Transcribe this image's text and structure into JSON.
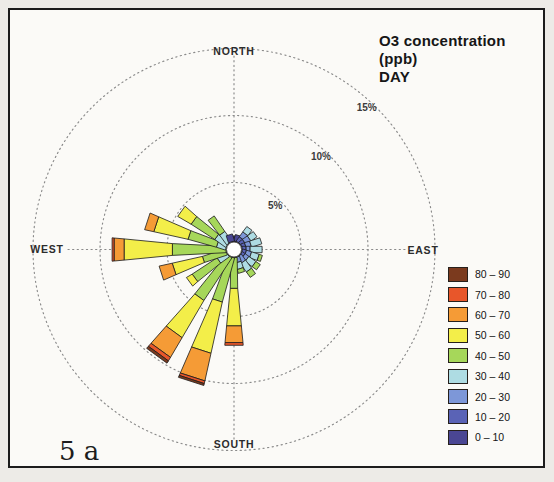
{
  "title": {
    "line1": "O3 concentration (ppb)",
    "line2": "DAY"
  },
  "corner_label": "5 a",
  "compass": {
    "north": "NORTH",
    "south": "SOUTH",
    "east": "EAST",
    "west": "WEST"
  },
  "chart_data": {
    "type": "bar",
    "subtype": "wind-rose-stacked-polar",
    "title": "O3 concentration (ppb)",
    "subtitle": "DAY",
    "radial_axis": "frequency percent",
    "rings": [
      {
        "pct": 5,
        "label": "5%"
      },
      {
        "pct": 10,
        "label": "10%"
      },
      {
        "pct": 15,
        "label": "15%"
      }
    ],
    "sector_step_deg": 18,
    "bins": [
      {
        "label": "0 – 10",
        "color": "#4a4693"
      },
      {
        "label": "10 – 20",
        "color": "#5a63b6"
      },
      {
        "label": "20 – 30",
        "color": "#7d97d8"
      },
      {
        "label": "30 – 40",
        "color": "#aedce3"
      },
      {
        "label": "40 – 50",
        "color": "#a6d75a"
      },
      {
        "label": "50 – 60",
        "color": "#f3ee49"
      },
      {
        "label": "60 – 70",
        "color": "#f59b36"
      },
      {
        "label": "70 – 80",
        "color": "#e8562a"
      },
      {
        "label": "80 – 90",
        "color": "#7b3a1e"
      }
    ],
    "petals": [
      {
        "dir": 0,
        "segments": [
          [
            0,
            0.6,
            1.0
          ]
        ]
      },
      {
        "dir": 18,
        "segments": [
          [
            0,
            0.6,
            1.1
          ]
        ]
      },
      {
        "dir": 36,
        "segments": [
          [
            1,
            0.6,
            1.0
          ],
          [
            2,
            1.0,
            1.45
          ],
          [
            3,
            1.45,
            1.95
          ]
        ]
      },
      {
        "dir": 54,
        "segments": [
          [
            1,
            0.6,
            0.95
          ],
          [
            2,
            0.95,
            1.4
          ],
          [
            3,
            1.4,
            1.95
          ]
        ]
      },
      {
        "dir": 72,
        "segments": [
          [
            1,
            0.6,
            0.9
          ],
          [
            2,
            0.9,
            1.3
          ],
          [
            3,
            1.3,
            2.1
          ]
        ]
      },
      {
        "dir": 90,
        "segments": [
          [
            1,
            0.6,
            0.9
          ],
          [
            2,
            0.9,
            1.2
          ],
          [
            3,
            1.2,
            2.1
          ]
        ]
      },
      {
        "dir": 108,
        "segments": [
          [
            1,
            0.6,
            0.9
          ],
          [
            2,
            0.9,
            1.3
          ],
          [
            3,
            1.3,
            1.9
          ],
          [
            4,
            1.9,
            2.15
          ]
        ]
      },
      {
        "dir": 126,
        "segments": [
          [
            1,
            0.6,
            0.85
          ],
          [
            2,
            0.85,
            1.2
          ],
          [
            3,
            1.2,
            1.85
          ],
          [
            4,
            1.85,
            2.25
          ]
        ]
      },
      {
        "dir": 144,
        "segments": [
          [
            2,
            0.6,
            1.15
          ],
          [
            3,
            1.15,
            1.9
          ],
          [
            4,
            1.9,
            2.4
          ]
        ]
      },
      {
        "dir": 162,
        "segments": [
          [
            2,
            0.6,
            1.0
          ],
          [
            3,
            1.0,
            1.5
          ],
          [
            4,
            1.5,
            1.8
          ]
        ]
      },
      {
        "dir": 180,
        "segments": [
          [
            4,
            0.6,
            2.9
          ],
          [
            5,
            2.9,
            5.7
          ],
          [
            6,
            5.7,
            6.95
          ],
          [
            7,
            6.95,
            7.15
          ]
        ]
      },
      {
        "dir": 198,
        "segments": [
          [
            4,
            0.6,
            4.0
          ],
          [
            5,
            4.0,
            7.9
          ],
          [
            6,
            7.9,
            10.0
          ],
          [
            7,
            10.0,
            10.2
          ],
          [
            8,
            10.2,
            10.35
          ]
        ]
      },
      {
        "dir": 216,
        "segments": [
          [
            4,
            0.6,
            4.4
          ],
          [
            5,
            4.4,
            7.6
          ],
          [
            6,
            7.6,
            9.3
          ],
          [
            7,
            9.3,
            9.6
          ],
          [
            8,
            9.6,
            9.8
          ]
        ]
      },
      {
        "dir": 234,
        "segments": [
          [
            3,
            0.6,
            1.4
          ],
          [
            4,
            1.4,
            3.6
          ],
          [
            5,
            3.6,
            4.1
          ]
        ]
      },
      {
        "dir": 252,
        "segments": [
          [
            4,
            0.6,
            2.4
          ],
          [
            5,
            2.4,
            4.7
          ],
          [
            6,
            4.7,
            5.7
          ]
        ]
      },
      {
        "dir": 270,
        "segments": [
          [
            4,
            0.6,
            4.6
          ],
          [
            5,
            4.6,
            8.2
          ],
          [
            6,
            8.2,
            8.95
          ],
          [
            7,
            8.95,
            9.1
          ]
        ]
      },
      {
        "dir": 288,
        "segments": [
          [
            3,
            0.6,
            1.3
          ],
          [
            4,
            1.3,
            3.5
          ],
          [
            5,
            3.5,
            6.1
          ],
          [
            6,
            6.1,
            6.8
          ]
        ]
      },
      {
        "dir": 306,
        "segments": [
          [
            3,
            0.6,
            1.6
          ],
          [
            4,
            1.6,
            3.7
          ],
          [
            5,
            3.7,
            4.85
          ]
        ]
      },
      {
        "dir": 324,
        "segments": [
          [
            3,
            0.6,
            1.5
          ],
          [
            4,
            1.5,
            2.9
          ]
        ]
      },
      {
        "dir": 342,
        "segments": [
          [
            0,
            0.6,
            1.15
          ]
        ]
      }
    ]
  }
}
